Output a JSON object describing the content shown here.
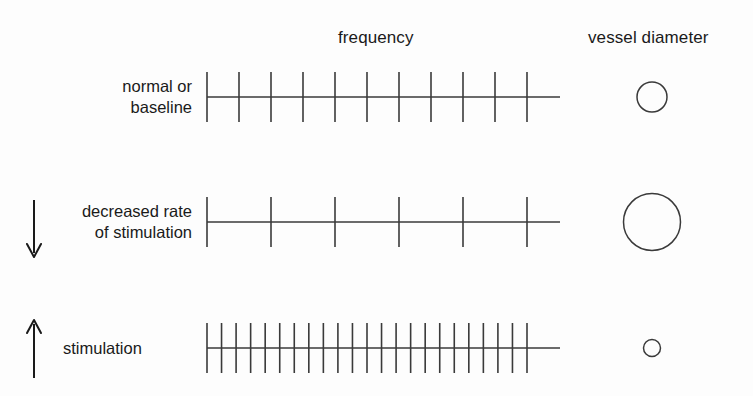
{
  "headers": {
    "frequency": "frequency",
    "vessel_diameter": "vessel diameter"
  },
  "colors": {
    "background": "#fdfdfd",
    "ink": "#3a3a3a",
    "text": "#1a1a1a"
  },
  "rows": [
    {
      "id": "normal-baseline",
      "label": "normal or\nbaseline",
      "label_align": "right",
      "arrow": "none",
      "tick_count": 11,
      "vessel_diameter_px": 30
    },
    {
      "id": "decreased-rate-of-stimulation",
      "label": "decreased rate\nof stimulation",
      "label_align": "right",
      "arrow": "down-arrow",
      "tick_count": 6,
      "vessel_diameter_px": 57
    },
    {
      "id": "stimulation",
      "label": "stimulation",
      "label_align": "left",
      "arrow": "up-arrow",
      "tick_count": 23,
      "vessel_diameter_px": 17
    }
  ],
  "chart_data": {
    "type": "diagram",
    "title": "",
    "columns": [
      "frequency",
      "vessel diameter"
    ],
    "series": [
      {
        "name": "normal or baseline",
        "frequency_ticks": 11,
        "vessel_diameter_relative": 1.0
      },
      {
        "name": "decreased rate of stimulation",
        "frequency_ticks": 6,
        "vessel_diameter_relative": 1.9
      },
      {
        "name": "stimulation",
        "frequency_ticks": 23,
        "vessel_diameter_relative": 0.57
      }
    ],
    "annotations": [
      {
        "row": "decreased rate of stimulation",
        "symbol": "down arrow"
      },
      {
        "row": "stimulation",
        "symbol": "up arrow"
      }
    ],
    "axis_start_x": 207,
    "axis_end_x": 560,
    "grid": false,
    "legend": "none"
  }
}
